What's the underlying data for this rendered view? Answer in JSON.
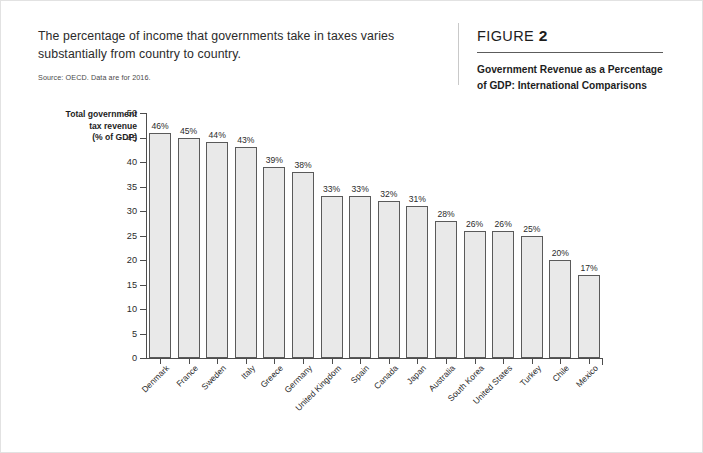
{
  "intro": {
    "text": "The percentage of income that governments take in taxes varies substantially from country to country.",
    "source": "Source: OECD. Data are for 2016."
  },
  "figure": {
    "label": "FIGURE",
    "number": "2",
    "title": "Government Revenue as a Percentage of GDP: International Comparisons"
  },
  "chart_data": {
    "type": "bar",
    "title": "Government Revenue as a Percentage of GDP: International Comparisons",
    "xlabel": "",
    "ylabel": "Total government tax revenue (% of GDP)",
    "ylabel_lines": [
      "Total government",
      "tax revenue",
      "(% of GDP)"
    ],
    "ylim": [
      0,
      50
    ],
    "yticks": [
      0,
      5,
      10,
      15,
      20,
      25,
      30,
      35,
      40,
      45,
      50
    ],
    "ytick_labels": [
      "0",
      "5",
      "10",
      "15",
      "20",
      "25",
      "30",
      "35",
      "40",
      "45",
      "50"
    ],
    "grid": false,
    "legend": false,
    "bar_color": "#e9e9e9",
    "bar_border_color": "#5a5a5a",
    "categories": [
      "Denmark",
      "France",
      "Sweden",
      "Italy",
      "Greece",
      "Germany",
      "United Kingdom",
      "Spain",
      "Canada",
      "Japan",
      "Australia",
      "South Korea",
      "United States",
      "Turkey",
      "Chile",
      "Mexico"
    ],
    "values": [
      46,
      45,
      44,
      43,
      39,
      38,
      33,
      33,
      32,
      31,
      28,
      26,
      26,
      25,
      20,
      17
    ],
    "value_labels": [
      "46%",
      "45%",
      "44%",
      "43%",
      "39%",
      "38%",
      "33%",
      "33%",
      "32%",
      "31%",
      "28%",
      "26%",
      "26%",
      "25%",
      "20%",
      "17%"
    ]
  }
}
